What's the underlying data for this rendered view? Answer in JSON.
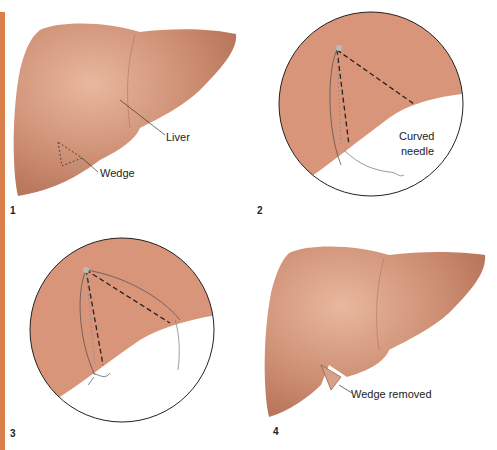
{
  "figure": {
    "panels": [
      {
        "step": "1",
        "labels": {
          "liver": "Liver",
          "wedge": "Wedge"
        }
      },
      {
        "step": "2",
        "labels": {
          "needle_line1": "Curved",
          "needle_line2": "needle"
        }
      },
      {
        "step": "3",
        "labels": {}
      },
      {
        "step": "4",
        "labels": {
          "wedge_removed": "Wedge removed"
        }
      }
    ],
    "colors": {
      "accent_bar": "#d9804a",
      "liver": "#c98a6e",
      "liver_highlight": "#e6b59b",
      "zoom_tissue": "#d9957a",
      "suture": "#555555",
      "dashed": "#222222"
    }
  }
}
